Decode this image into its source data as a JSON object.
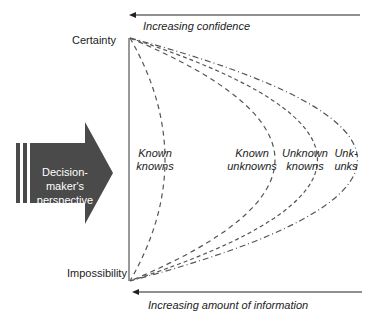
{
  "top_axis": {
    "label": "Increasing confidence"
  },
  "bottom_axis": {
    "label": "Increasing amount of information"
  },
  "y_labels": {
    "top": "Certainty",
    "bottom": "Impossibility"
  },
  "perspective_arrow": {
    "line1": "Decision-",
    "line2": "maker's",
    "line3": "perspective"
  },
  "regions": [
    {
      "line1": "Known",
      "line2": "knowns"
    },
    {
      "line1": "Known",
      "line2": "unknowns"
    },
    {
      "line1": "Unknown",
      "line2": "knowns"
    },
    {
      "line1": "Unk-",
      "line2": "unks"
    }
  ],
  "colors": {
    "line": "#222222",
    "curve": "#555555",
    "arrow_fill": "#4a4a4a"
  }
}
